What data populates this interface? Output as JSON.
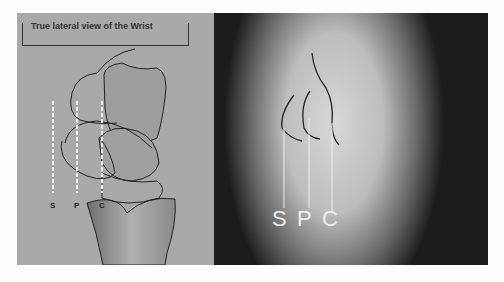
{
  "figure": {
    "diagram": {
      "title": "True lateral view of the Wrist",
      "labels": [
        "S",
        "P",
        "C"
      ]
    },
    "xray": {
      "labels": [
        "S",
        "P",
        "C"
      ]
    }
  }
}
